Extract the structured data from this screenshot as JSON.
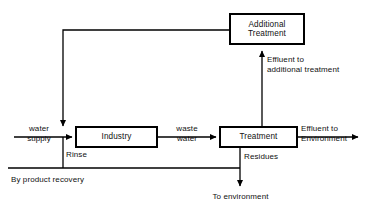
{
  "diagram": {
    "type": "block-flow-diagram",
    "stroke_color": "#000000",
    "background_color": "#ffffff",
    "nodes": [
      {
        "id": "additional_treatment",
        "label": "Additional\nTreatment"
      },
      {
        "id": "industry",
        "label": "Industry"
      },
      {
        "id": "treatment",
        "label": "Treatment"
      }
    ],
    "edge_labels": [
      {
        "id": "water_supply",
        "text": "water\nsupply"
      },
      {
        "id": "rinse",
        "text": "Rinse"
      },
      {
        "id": "waste_water",
        "text": "waste\nwater"
      },
      {
        "id": "effluent_additional",
        "text": "Effluent to\nadditional treatment"
      },
      {
        "id": "effluent_environment",
        "text": "Effluent to\nEnvironment"
      },
      {
        "id": "residues",
        "text": "Residues"
      },
      {
        "id": "to_environment",
        "text": "To environment"
      },
      {
        "id": "by_product_recovery",
        "text": "By product recovery"
      }
    ]
  }
}
